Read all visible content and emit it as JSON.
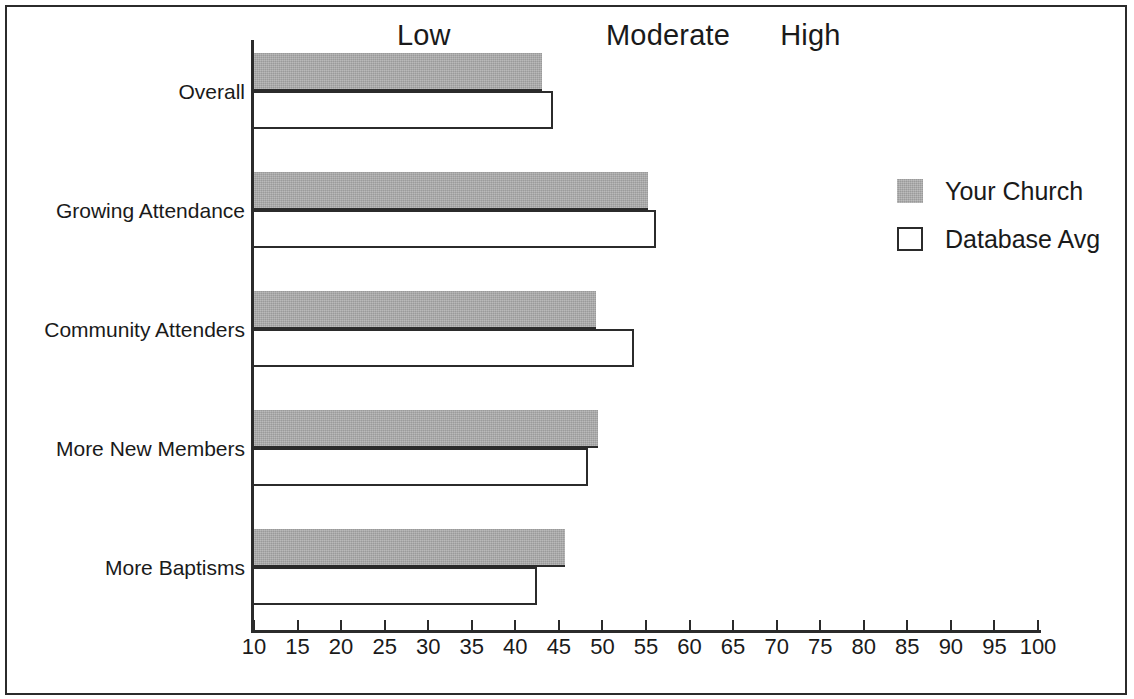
{
  "chart_data": {
    "type": "bar",
    "orientation": "horizontal",
    "title": "",
    "xlabel": "",
    "ylabel": "",
    "xlim": [
      10,
      100
    ],
    "grid": false,
    "legend_position": "right",
    "categories": [
      "Overall",
      "Growing Attendance",
      "Community Attenders",
      "More New Members",
      "More Baptisms"
    ],
    "series": [
      {
        "name": "Your Church",
        "color": "#a9a9a9",
        "values": [
          43.1,
          55.2,
          49.3,
          49.5,
          45.7
        ]
      },
      {
        "name": "Database Avg",
        "color": "#ffffff",
        "values": [
          44.3,
          56.1,
          53.6,
          48.3,
          42.5
        ]
      }
    ],
    "x_ticks": [
      10,
      15,
      20,
      25,
      30,
      35,
      40,
      45,
      50,
      55,
      60,
      65,
      70,
      75,
      80,
      85,
      90,
      95,
      100
    ],
    "x_tick_labels": [
      "10",
      "15",
      "20",
      "25",
      "30",
      "35",
      "40",
      "45",
      "50",
      "55",
      "60",
      "65",
      "70",
      "75",
      "80",
      "85",
      "90",
      "95",
      "100"
    ],
    "annotations": [
      {
        "text": "Low",
        "x_value": 31,
        "position": "top"
      },
      {
        "text": "Moderate",
        "x_value": 55,
        "position": "top"
      },
      {
        "text": "High",
        "x_value": 75,
        "position": "top"
      }
    ]
  },
  "legend": {
    "items": [
      {
        "label": "Your Church",
        "swatch": "filled-gray-square"
      },
      {
        "label": "Database Avg",
        "swatch": "open-black-square"
      }
    ]
  },
  "colors": {
    "bar_your_church": "#a9a9a9",
    "bar_database_avg": "#ffffff",
    "axis": "#2b2b2b",
    "text": "#1a1a1a",
    "frame": "#2b2b2b",
    "background": "#ffffff"
  }
}
